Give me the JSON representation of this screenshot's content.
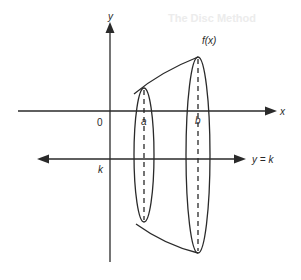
{
  "background_text": {
    "heading": "The Disc Method",
    "line": "... the solid of revolution ..."
  },
  "diagram": {
    "labels": {
      "y_axis": "y",
      "x_axis": "x",
      "origin": "0",
      "a": "a",
      "b": "b",
      "k": "k",
      "function": "f(x)",
      "line": "y = k"
    },
    "colors": {
      "stroke": "#2a2a2a",
      "background": "#ffffff"
    }
  }
}
